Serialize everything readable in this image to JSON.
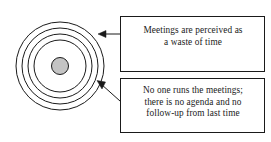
{
  "diagram": {
    "type": "concentric-circles-with-callouts",
    "title": "",
    "background_color": "#ffffff",
    "line_color": "#1a1a1a",
    "core_fill_color": "#c4c4c4",
    "box_fill_color": "#ffffff",
    "concentric": {
      "name": "concentric-rings",
      "center": {
        "x": 60,
        "y": 66
      },
      "ring_count": 4,
      "ring_radii": [
        44,
        38,
        32,
        26
      ],
      "core_radius": 8,
      "core_filled": true
    },
    "callouts": [
      {
        "id": "callout-1",
        "name": "callout-box-perception",
        "x": 120,
        "y": 16,
        "width": 145,
        "height": 56,
        "lines": [
          "Meetings are perceived as",
          "a waste of time"
        ],
        "arrow": {
          "name": "arrow-to-outer-ring",
          "from": {
            "x": 120,
            "y": 34
          },
          "to": {
            "x": 99,
            "y": 34
          },
          "direction": "left",
          "style": "straight"
        }
      },
      {
        "id": "callout-2",
        "name": "callout-box-no-agenda",
        "x": 120,
        "y": 78,
        "width": 145,
        "height": 55,
        "lines": [
          "No one runs the meetings;",
          "there is no agenda and no",
          "follow-up from last time"
        ],
        "arrow": {
          "name": "arrow-to-middle-ring",
          "from": {
            "x": 120,
            "y": 100
          },
          "to": {
            "x": 98,
            "y": 81
          },
          "direction": "up-left",
          "style": "diagonal"
        }
      }
    ]
  }
}
